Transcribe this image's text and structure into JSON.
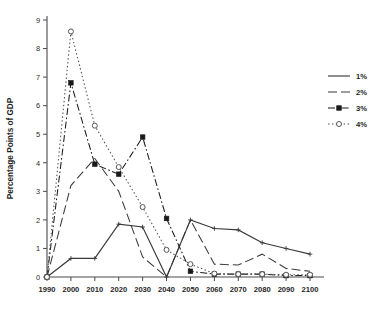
{
  "chart_data": {
    "type": "line",
    "title": "",
    "xlabel": "",
    "ylabel": "Percentage Points of GDP",
    "xlim": [
      1990,
      2100
    ],
    "ylim": [
      0,
      9
    ],
    "grid": false,
    "legend_position": "right",
    "x": [
      1990,
      2000,
      2010,
      2020,
      2030,
      2040,
      2050,
      2060,
      2070,
      2080,
      2090,
      2100
    ],
    "xtick_labels": [
      "1990",
      "2000",
      "2010",
      "2020",
      "2030",
      "2040",
      "2050",
      "2060",
      "2070",
      "2080",
      "2090",
      "2100"
    ],
    "ytick_labels": [
      "0",
      "1",
      "2",
      "3",
      "4",
      "5",
      "6",
      "7",
      "8",
      "9"
    ],
    "ytick_values": [
      0,
      1,
      2,
      3,
      4,
      5,
      6,
      7,
      8,
      9
    ],
    "series": [
      {
        "name": "1%",
        "style": "solid",
        "marker": "plus",
        "color": "#3a3a3a",
        "values": [
          0.0,
          0.65,
          0.65,
          1.85,
          1.75,
          0.0,
          2.0,
          1.7,
          1.65,
          1.2,
          1.0,
          0.8
        ]
      },
      {
        "name": "2%",
        "style": "long-dash",
        "marker": "none",
        "color": "#3a3a3a",
        "values": [
          0.0,
          3.2,
          4.15,
          3.0,
          0.7,
          0.0,
          2.0,
          0.45,
          0.42,
          0.8,
          0.3,
          0.2
        ]
      },
      {
        "name": "3%",
        "style": "dash-dot",
        "marker": "filled-square",
        "color": "#1a1a1a",
        "values": [
          0.0,
          6.8,
          3.95,
          3.6,
          4.9,
          2.05,
          0.2,
          0.1,
          0.1,
          0.1,
          0.05,
          0.05
        ]
      },
      {
        "name": "4%",
        "style": "dotted",
        "marker": "open-circle",
        "color": "#555555",
        "values": [
          0.0,
          8.6,
          5.3,
          3.85,
          2.45,
          0.95,
          0.45,
          0.12,
          0.1,
          0.1,
          0.08,
          0.08
        ]
      }
    ]
  },
  "legend": {
    "entries": [
      {
        "label": "1%"
      },
      {
        "label": "2%"
      },
      {
        "label": "3%"
      },
      {
        "label": "4%"
      }
    ]
  },
  "axes": {
    "y_title": "Percentage Points of GDP"
  }
}
